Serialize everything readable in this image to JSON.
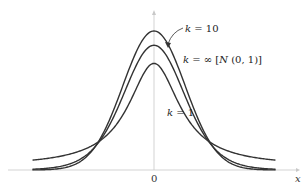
{
  "chart_data": {
    "type": "line",
    "title": "",
    "xlabel": "x",
    "ylabel": "",
    "x_ticks": [
      "0"
    ],
    "grid": false,
    "legend": "inline annotations",
    "xlim": [
      -4,
      4
    ],
    "series": [
      {
        "name": "k = ∞ [N (0, 1)]",
        "distribution": "standard normal",
        "peak": 0.399,
        "color": "#333333"
      },
      {
        "name": "k = 10",
        "distribution": "t, 10 degrees of freedom",
        "peak": 0.389,
        "color": "#333333"
      },
      {
        "name": "k = 1",
        "distribution": "t, 1 degree of freedom",
        "peak": 0.318,
        "color": "#333333"
      }
    ],
    "annotations": [
      {
        "text": "k = 10",
        "points_to": "middle curve"
      },
      {
        "text": "k = ∞ [N (0, 1)]",
        "points_to": "top curve"
      },
      {
        "text": "k = 1",
        "points_to": "bottom curve"
      }
    ]
  },
  "labels": {
    "k10_k": "k",
    "k10_rest": " = 10",
    "kinf_k": "k",
    "kinf_rest": " = ∞ [",
    "kinf_N": "N",
    "kinf_tail": " (0, 1)]",
    "k1_k": "k",
    "k1_rest": " = 1",
    "x_axis": "x",
    "origin": "0"
  }
}
